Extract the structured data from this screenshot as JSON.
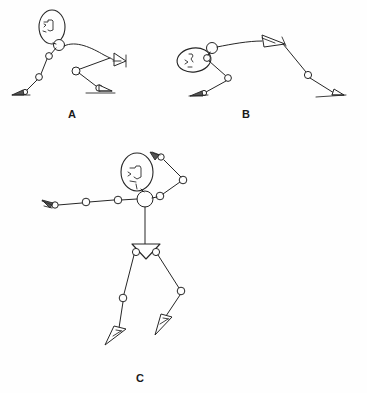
{
  "document": {
    "title": "Stick Figure Pose Diagram",
    "background_color": "#fefefe",
    "ink_color": "#262626",
    "width": 367,
    "height": 393
  },
  "panels": [
    {
      "id": "A",
      "label": "A",
      "label_x": 72,
      "label_y": 118,
      "pose_description": "crouching figure leaning forward, arm extended forward, one leg extended back",
      "joint_count": 8
    },
    {
      "id": "B",
      "label": "B",
      "label_x": 246,
      "label_y": 118,
      "pose_description": "horizontal diving or lunging figure, head tilted left, limbs extended right",
      "joint_count": 7
    },
    {
      "id": "C",
      "label": "C",
      "label_x": 140,
      "label_y": 382,
      "pose_description": "upright standing figure, left arm extended sideways, right arm raised and bent, legs striding",
      "joint_count": 13
    }
  ],
  "legend": {
    "joint_marker": "circle",
    "head_marker": "ellipse-profile",
    "hand_marker": "triangle",
    "foot_marker": "triangle"
  },
  "icons": {
    "joint": "joint-circle-icon",
    "head": "head-profile-icon",
    "hand": "hand-triangle-icon",
    "foot": "foot-triangle-icon",
    "pelvis": "pelvis-triangle-icon"
  }
}
